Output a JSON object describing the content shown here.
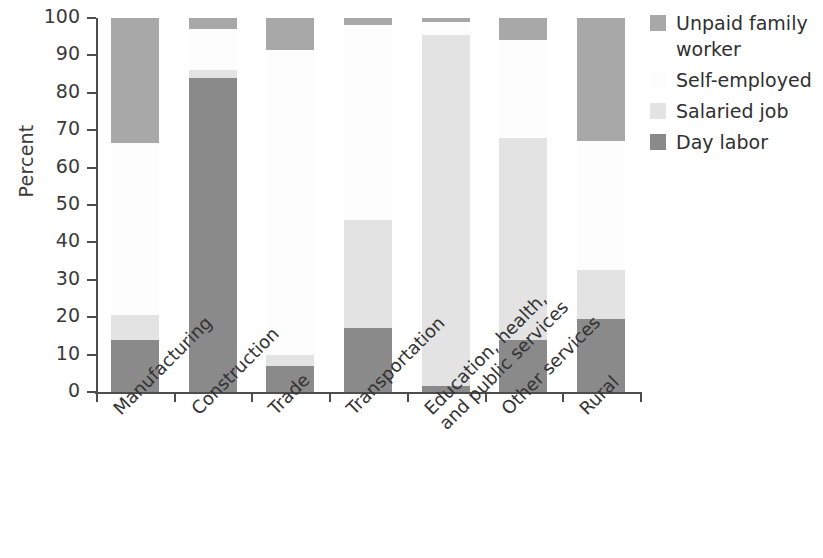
{
  "chart_data": {
    "type": "bar",
    "subtype": "stacked-bar-100",
    "title": "",
    "xlabel": "",
    "ylabel": "Percent",
    "ylim": [
      0,
      100
    ],
    "yticks": [
      0,
      10,
      20,
      30,
      40,
      50,
      60,
      70,
      80,
      90,
      100
    ],
    "grid": false,
    "legend_position": "right",
    "categories": [
      "Manufacturing",
      "Construction",
      "Trade",
      "Transportation",
      "Education, health,\nand public services",
      "Other services",
      "Rural"
    ],
    "series": [
      {
        "name": "Day labor",
        "color": "#8a8a8a",
        "values": [
          14,
          84,
          7,
          17,
          1.5,
          14,
          19.5
        ]
      },
      {
        "name": "Salaried job",
        "color": "#e3e3e3",
        "values": [
          6.5,
          2,
          3,
          29,
          94,
          54,
          13
        ]
      },
      {
        "name": "Self-employed",
        "color": "#fdfdfd",
        "values": [
          46,
          11,
          81.5,
          52,
          3.5,
          26,
          34.5
        ]
      },
      {
        "name": "Unpaid family worker",
        "color": "#a8a8a8",
        "values": [
          33.5,
          3,
          8.5,
          2,
          1,
          6,
          33
        ]
      }
    ],
    "legend_order": [
      "Unpaid family worker",
      "Self-employed",
      "Salaried job",
      "Day labor"
    ]
  },
  "legend": {
    "items": [
      {
        "label": "Unpaid family worker",
        "color": "#a8a8a8"
      },
      {
        "label": "Self-employed",
        "color": "#fdfdfd"
      },
      {
        "label": "Salaried job",
        "color": "#e3e3e3"
      },
      {
        "label": "Day labor",
        "color": "#8a8a8a"
      }
    ]
  },
  "axes": {
    "y_title": "Percent",
    "y_tick_labels": [
      "100",
      "90",
      "80",
      "70",
      "60",
      "50",
      "40",
      "30",
      "20",
      "10",
      "0"
    ],
    "x_tick_labels": [
      "Manufacturing",
      "Construction",
      "Trade",
      "Transportation",
      "Education, health,",
      "and public services",
      "Other services",
      "Rural"
    ]
  }
}
